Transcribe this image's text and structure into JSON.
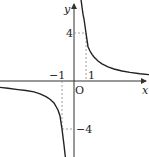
{
  "diagram": {
    "type": "function-graph",
    "function": "y = 4/x",
    "axes": {
      "x_label": "x",
      "y_label": "y",
      "origin_label": "O"
    },
    "tick_labels": {
      "x_pos": "1",
      "x_neg": "−1",
      "y_pos": "4",
      "y_neg": "−4"
    },
    "marked_points": [
      {
        "x": 1,
        "y": 4
      },
      {
        "x": -1,
        "y": -4
      }
    ],
    "colors": {
      "curve": "#222222",
      "axis": "#333333",
      "dashed": "#888888"
    }
  }
}
